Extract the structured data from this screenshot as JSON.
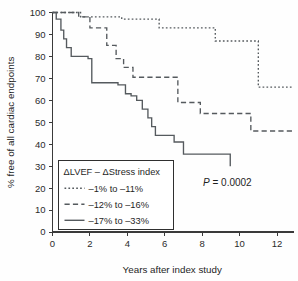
{
  "figure": {
    "name": "kaplan-meier-cardiac-endpoints",
    "background_color": "#fefefe",
    "line_color": "#555a5e",
    "axis_color": "#3a3a3a",
    "text_color": "#1f1f1f"
  },
  "annotations": {
    "pvalue_symbol": "P",
    "pvalue_rest": " = 0.0002"
  },
  "legend": {
    "title": "ΔLVEF – ΔStress index",
    "entries": [
      {
        "label": "–1% to –11%",
        "style": "dotted"
      },
      {
        "label": "–12% to –16%",
        "style": "dashed"
      },
      {
        "label": "–17% to –33%",
        "style": "solid"
      }
    ]
  },
  "chart_data": {
    "type": "line",
    "subtype": "kaplan-meier-step",
    "title": "",
    "xlabel": "Years after index study",
    "ylabel": "% free of all cardiac endpoints",
    "xlim": [
      0,
      12.8
    ],
    "ylim": [
      0,
      100
    ],
    "xticks": [
      0,
      2,
      4,
      6,
      8,
      10,
      12
    ],
    "xtick_labels": [
      "0",
      "2",
      "4",
      "6",
      "8",
      "10",
      "12"
    ],
    "yticks": [
      0,
      10,
      20,
      30,
      40,
      50,
      60,
      70,
      80,
      90,
      100
    ],
    "ytick_labels": [
      "0",
      "10",
      "20",
      "30",
      "40",
      "50",
      "60",
      "70",
      "80",
      "90",
      "100"
    ],
    "grid": false,
    "legend_position": "lower-left",
    "annotation_text": "P = 0.0002",
    "series": [
      {
        "name": "–1% to –11%",
        "style": "dotted",
        "x": [
          0.0,
          1.5,
          3.7,
          5.7,
          8.7,
          11.0,
          12.8
        ],
        "y": [
          100,
          98,
          97,
          93,
          87,
          66,
          66
        ]
      },
      {
        "name": "–12% to –16%",
        "style": "dashed",
        "x": [
          0.0,
          1.4,
          2.0,
          2.9,
          3.4,
          3.8,
          4.3,
          6.7,
          7.9,
          10.6,
          12.8
        ],
        "y": [
          100,
          98,
          93,
          85,
          79,
          75,
          70.5,
          59,
          54,
          46,
          46
        ]
      },
      {
        "name": "–17% to –33%",
        "style": "solid",
        "x": [
          0.0,
          0.2,
          0.45,
          0.6,
          0.75,
          1.0,
          1.9,
          2.1,
          3.5,
          3.9,
          4.2,
          4.5,
          4.8,
          5.1,
          5.3,
          5.5,
          6.5,
          7.0,
          9.5,
          9.5
        ],
        "y": [
          100,
          97,
          92,
          88,
          84,
          80,
          79,
          68,
          67,
          63,
          62,
          60,
          56,
          52,
          48,
          44,
          41,
          35.5,
          35.5,
          30
        ]
      }
    ]
  }
}
